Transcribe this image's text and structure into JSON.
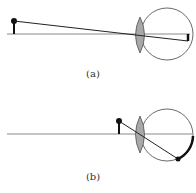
{
  "diagram": {
    "panels": [
      {
        "id": "a",
        "label": "(a)",
        "description": "object far from eye; image focused on retina"
      },
      {
        "id": "b",
        "label": "(b)",
        "description": "object near eye; image falls behind retina"
      }
    ],
    "colors": {
      "line": "#222222",
      "axis": "#888888",
      "lens_fill": "#a8a8a8",
      "eye_outline": "#444444"
    }
  }
}
